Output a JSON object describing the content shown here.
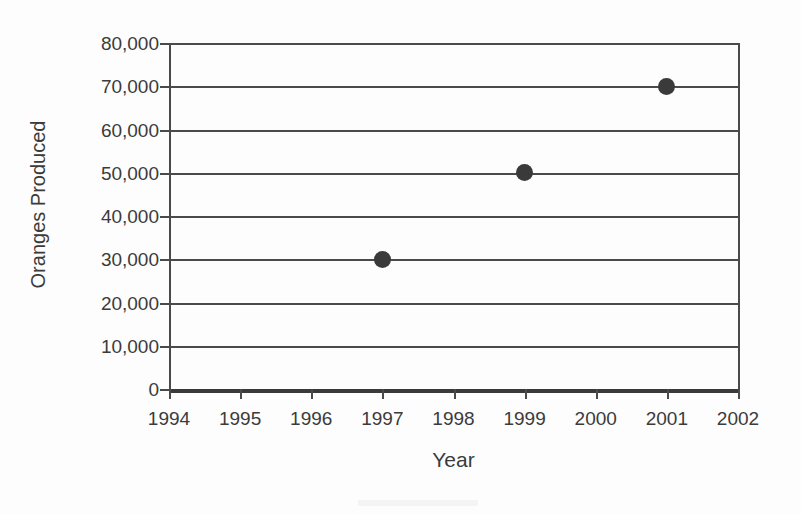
{
  "chart_data": {
    "type": "scatter",
    "title": "",
    "xlabel": "Year",
    "ylabel": "Oranges Produced",
    "x": [
      1997,
      1999,
      2001
    ],
    "values": [
      30000,
      50000,
      70000
    ],
    "points": [
      {
        "x": 1997,
        "y": 30000,
        "label": "30,000"
      },
      {
        "x": 1999,
        "y": 50000,
        "label": "50,000"
      },
      {
        "x": 2001,
        "y": 70000,
        "label": "70,000"
      }
    ],
    "xlim": [
      1994,
      2002
    ],
    "ylim": [
      0,
      80000
    ],
    "x_ticks": [
      1994,
      1995,
      1996,
      1997,
      1998,
      1999,
      2000,
      2001,
      2002
    ],
    "x_tick_labels": [
      "1994",
      "1995",
      "1996",
      "1997",
      "1998",
      "1999",
      "2000",
      "2001",
      "2002"
    ],
    "y_ticks": [
      0,
      10000,
      20000,
      30000,
      40000,
      50000,
      60000,
      70000,
      80000
    ],
    "y_tick_labels": [
      "0",
      "10,000",
      "20,000",
      "30,000",
      "40,000",
      "50,000",
      "60,000",
      "70,000",
      "80,000"
    ],
    "grid": true,
    "grid_axis": "y",
    "legend": false,
    "legend_position": "none",
    "marker": "circle",
    "marker_color": "#3a3a3a",
    "grid_color": "#4a4a4a",
    "background_color": "#fdfdfd",
    "text_color": "#3b3b3b"
  }
}
